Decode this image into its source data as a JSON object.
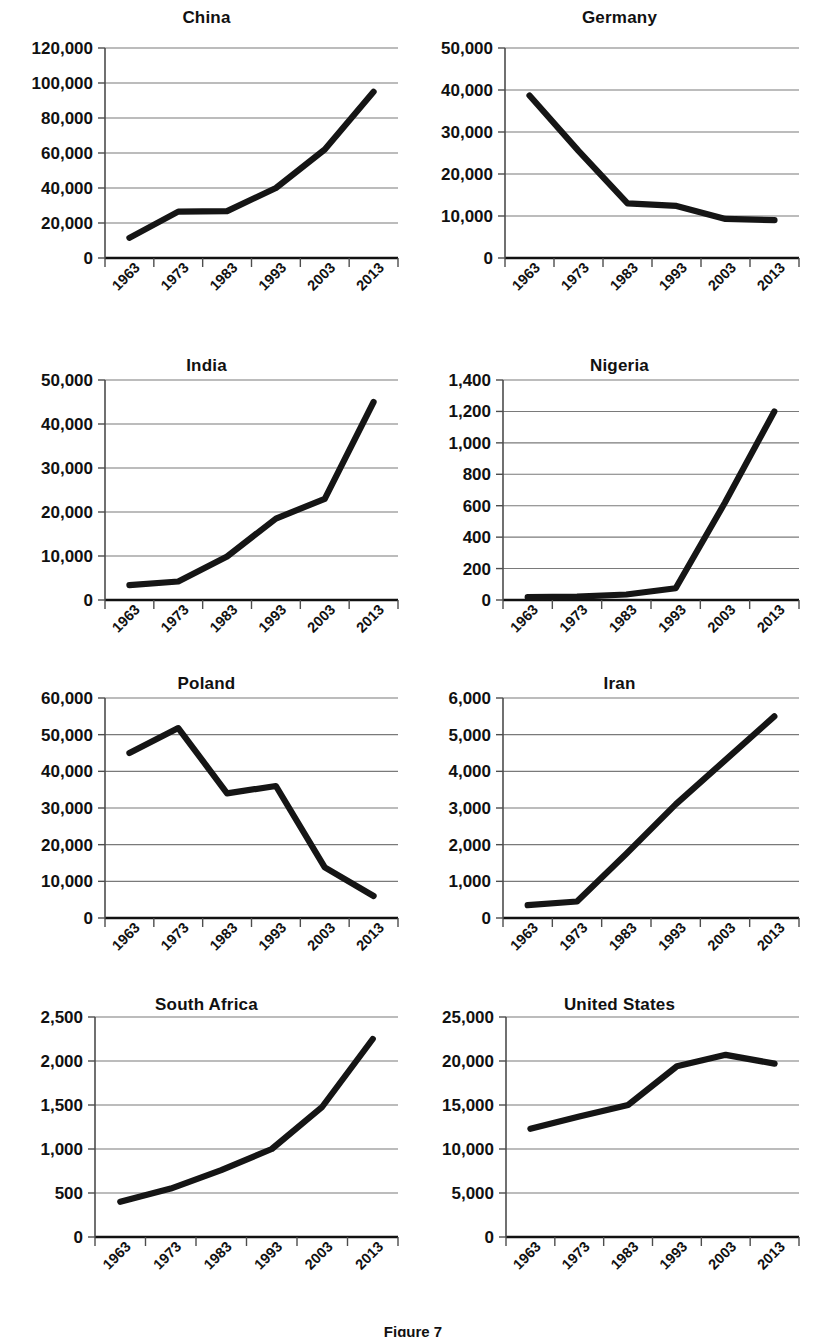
{
  "figure": {
    "caption": "Figure 7",
    "x_categories": [
      "1963",
      "1973",
      "1983",
      "1993",
      "2003",
      "2013"
    ]
  },
  "panels": [
    {
      "id": "china",
      "title": "China"
    },
    {
      "id": "germany",
      "title": "Germany"
    },
    {
      "id": "india",
      "title": "India"
    },
    {
      "id": "nigeria",
      "title": "Nigeria"
    },
    {
      "id": "poland",
      "title": "Poland"
    },
    {
      "id": "iran",
      "title": "Iran"
    },
    {
      "id": "south-africa",
      "title": "South Africa"
    },
    {
      "id": "united-states",
      "title": "United States"
    }
  ],
  "chart_data": [
    {
      "type": "line",
      "title": "China",
      "xlabel": "",
      "ylabel": "",
      "categories": [
        "1963",
        "1973",
        "1983",
        "1993",
        "2003",
        "2013"
      ],
      "values": [
        11500,
        26500,
        26800,
        40000,
        62000,
        95000
      ],
      "ylim": [
        0,
        120000
      ],
      "yticks": [
        0,
        20000,
        40000,
        60000,
        80000,
        100000,
        120000
      ],
      "ytick_labels": [
        "0",
        "20,000",
        "40,000",
        "60,000",
        "80,000",
        "100,000",
        "120,000"
      ],
      "grid": true,
      "legend": "none"
    },
    {
      "type": "line",
      "title": "Germany",
      "xlabel": "",
      "ylabel": "",
      "categories": [
        "1963",
        "1973",
        "1983",
        "1993",
        "2003",
        "2013"
      ],
      "values": [
        38700,
        25500,
        13000,
        12400,
        9300,
        9000
      ],
      "ylim": [
        0,
        50000
      ],
      "yticks": [
        0,
        10000,
        20000,
        30000,
        40000,
        50000
      ],
      "ytick_labels": [
        "0",
        "10,000",
        "20,000",
        "30,000",
        "40,000",
        "50,000"
      ],
      "grid": true,
      "legend": "none"
    },
    {
      "type": "line",
      "title": "India",
      "xlabel": "",
      "ylabel": "",
      "categories": [
        "1963",
        "1973",
        "1983",
        "1993",
        "2003",
        "2013"
      ],
      "values": [
        3400,
        4200,
        9900,
        18500,
        23000,
        45000
      ],
      "ylim": [
        0,
        50000
      ],
      "yticks": [
        0,
        10000,
        20000,
        30000,
        40000,
        50000
      ],
      "ytick_labels": [
        "0",
        "10,000",
        "20,000",
        "30,000",
        "40,000",
        "50,000"
      ],
      "grid": true,
      "legend": "none"
    },
    {
      "type": "line",
      "title": "Nigeria",
      "xlabel": "",
      "ylabel": "",
      "categories": [
        "1963",
        "1973",
        "1983",
        "1993",
        "2003",
        "2013"
      ],
      "values": [
        18,
        22,
        35,
        75,
        620,
        1200
      ],
      "ylim": [
        0,
        1400
      ],
      "yticks": [
        0,
        200,
        400,
        600,
        800,
        1000,
        1200,
        1400
      ],
      "ytick_labels": [
        "0",
        "200",
        "400",
        "600",
        "800",
        "1,000",
        "1,200",
        "1,400"
      ],
      "grid": true,
      "legend": "none"
    },
    {
      "type": "line",
      "title": "Poland",
      "xlabel": "",
      "ylabel": "",
      "categories": [
        "1963",
        "1973",
        "1983",
        "1993",
        "2003",
        "2013"
      ],
      "values": [
        45000,
        51800,
        34000,
        36000,
        13800,
        6000
      ],
      "ylim": [
        0,
        60000
      ],
      "yticks": [
        0,
        10000,
        20000,
        30000,
        40000,
        50000,
        60000
      ],
      "ytick_labels": [
        "0",
        "10,000",
        "20,000",
        "30,000",
        "40,000",
        "50,000",
        "60,000"
      ],
      "grid": true,
      "legend": "none"
    },
    {
      "type": "line",
      "title": "Iran",
      "xlabel": "",
      "ylabel": "",
      "categories": [
        "1963",
        "1973",
        "1983",
        "1993",
        "2003",
        "2013"
      ],
      "values": [
        350,
        450,
        1750,
        3100,
        4300,
        5500
      ],
      "ylim": [
        0,
        6000
      ],
      "yticks": [
        0,
        1000,
        2000,
        3000,
        4000,
        5000,
        6000
      ],
      "ytick_labels": [
        "0",
        "1,000",
        "2,000",
        "3,000",
        "4,000",
        "5,000",
        "6,000"
      ],
      "grid": true,
      "legend": "none"
    },
    {
      "type": "line",
      "title": "South Africa",
      "xlabel": "",
      "ylabel": "",
      "categories": [
        "1963",
        "1973",
        "1983",
        "1993",
        "2003",
        "2013"
      ],
      "values": [
        400,
        550,
        760,
        1000,
        1480,
        2250
      ],
      "ylim": [
        0,
        2500
      ],
      "yticks": [
        0,
        500,
        1000,
        1500,
        2000,
        2500
      ],
      "ytick_labels": [
        "0",
        "500",
        "1,000",
        "1,500",
        "2,000",
        "2,500"
      ],
      "grid": true,
      "legend": "none"
    },
    {
      "type": "line",
      "title": "United States",
      "xlabel": "",
      "ylabel": "",
      "categories": [
        "1963",
        "1973",
        "1983",
        "1993",
        "2003",
        "2013"
      ],
      "values": [
        12300,
        13700,
        15000,
        19400,
        20700,
        19700
      ],
      "ylim": [
        0,
        25000
      ],
      "yticks": [
        0,
        5000,
        10000,
        15000,
        20000,
        25000
      ],
      "ytick_labels": [
        "0",
        "5,000",
        "10,000",
        "15,000",
        "20,000",
        "25,000"
      ],
      "grid": true,
      "legend": "none"
    }
  ]
}
